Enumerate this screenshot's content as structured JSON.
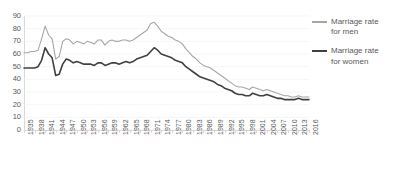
{
  "chart_data": {
    "type": "line",
    "title": "",
    "xlabel": "",
    "ylabel": "",
    "ylim": [
      0,
      90
    ],
    "ytick_step": 10,
    "yticks": [
      0,
      10,
      20,
      30,
      40,
      50,
      60,
      70,
      80,
      90
    ],
    "grid": true,
    "legend_position": "right",
    "x_start": 1935,
    "x_end": 2016,
    "xtick_step": 3,
    "tick_labels": [
      "1935",
      "1938",
      "1941",
      "1944",
      "1947",
      "1950",
      "1953",
      "1956",
      "1959",
      "1962",
      "1965",
      "1968",
      "1971",
      "1974",
      "1977",
      "1980",
      "1983",
      "1986",
      "1989",
      "1992",
      "1995",
      "1998",
      "2001",
      "2004",
      "2007",
      "2010",
      "2013",
      "2016"
    ],
    "x": [
      1935,
      1936,
      1937,
      1938,
      1939,
      1940,
      1941,
      1942,
      1943,
      1944,
      1945,
      1946,
      1947,
      1948,
      1949,
      1950,
      1951,
      1952,
      1953,
      1954,
      1955,
      1956,
      1957,
      1958,
      1959,
      1960,
      1961,
      1962,
      1963,
      1964,
      1965,
      1966,
      1967,
      1968,
      1969,
      1970,
      1971,
      1972,
      1973,
      1974,
      1975,
      1976,
      1977,
      1978,
      1979,
      1980,
      1981,
      1982,
      1983,
      1984,
      1985,
      1986,
      1987,
      1988,
      1989,
      1990,
      1991,
      1992,
      1993,
      1994,
      1995,
      1996,
      1997,
      1998,
      1999,
      2000,
      2001,
      2002,
      2003,
      2004,
      2005,
      2006,
      2007,
      2008,
      2009,
      2010,
      2011,
      2012,
      2013,
      2014,
      2015,
      2016
    ],
    "series": [
      {
        "name": "Marriage rate for men",
        "color": "#a6a6a6",
        "values": [
          61,
          61,
          62,
          62,
          63,
          72,
          82,
          75,
          72,
          56,
          58,
          70,
          72,
          71,
          68,
          70,
          69,
          68,
          70,
          69,
          68,
          71,
          71,
          67,
          70,
          71,
          70,
          70,
          71,
          71,
          70,
          71,
          73,
          75,
          77,
          79,
          84,
          85,
          82,
          78,
          76,
          74,
          73,
          71,
          70,
          68,
          64,
          61,
          58,
          56,
          53,
          51,
          50,
          49,
          47,
          45,
          43,
          41,
          39,
          37,
          35,
          34,
          34,
          33,
          32,
          34,
          33,
          32,
          31,
          32,
          31,
          30,
          29,
          28,
          27,
          27,
          26,
          26,
          27,
          26,
          26,
          26
        ]
      },
      {
        "name": "Marriage rate for women",
        "color": "#404040",
        "values": [
          49,
          49,
          49,
          49,
          50,
          55,
          65,
          60,
          57,
          43,
          44,
          52,
          56,
          55,
          53,
          54,
          53,
          52,
          52,
          52,
          51,
          53,
          53,
          51,
          52,
          53,
          53,
          52,
          53,
          54,
          53,
          54,
          56,
          57,
          58,
          59,
          62,
          65,
          63,
          60,
          59,
          58,
          57,
          55,
          54,
          53,
          50,
          48,
          46,
          44,
          42,
          41,
          40,
          39,
          38,
          36,
          35,
          33,
          32,
          31,
          29,
          28,
          28,
          27,
          27,
          29,
          28,
          27,
          27,
          28,
          27,
          26,
          25,
          25,
          24,
          24,
          24,
          24,
          25,
          24,
          24,
          24
        ]
      }
    ]
  },
  "legend": {
    "items": [
      {
        "label": "Marriage rate for men",
        "color": "#a6a6a6"
      },
      {
        "label": "Marriage rate for women",
        "color": "#404040"
      }
    ]
  }
}
